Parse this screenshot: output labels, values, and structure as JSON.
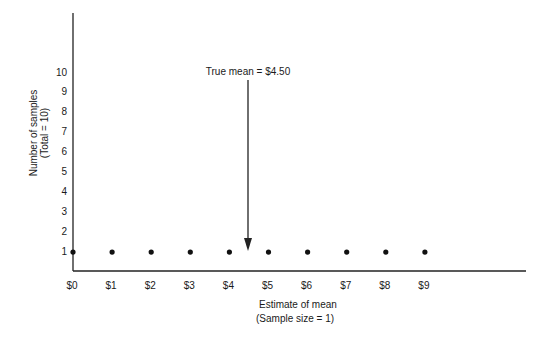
{
  "chart_data": {
    "type": "scatter",
    "title": "",
    "xlabel": "Estimate of mean",
    "xlabel_sub": "(Sample size = 1)",
    "ylabel": "Number of samples",
    "ylabel_sub": "(Total = 10)",
    "x_ticks": [
      "$0",
      "$1",
      "$2",
      "$3",
      "$4",
      "$5",
      "$6",
      "$7",
      "$8",
      "$9"
    ],
    "y_ticks": [
      "1",
      "2",
      "3",
      "4",
      "5",
      "6",
      "7",
      "8",
      "9",
      "10"
    ],
    "xlim": [
      0,
      12
    ],
    "ylim": [
      0,
      12
    ],
    "grid": false,
    "series": [
      {
        "name": "samples",
        "x": [
          0.0,
          1.0,
          2.0,
          3.0,
          4.0,
          5.0,
          6.0,
          7.0,
          8.0,
          9.0
        ],
        "y": [
          1,
          1,
          1,
          1,
          1,
          1,
          1,
          1,
          1,
          1
        ]
      }
    ],
    "annotations": [
      {
        "text": "True mean = $4.50",
        "x": 4.5,
        "arrow": "down"
      }
    ]
  }
}
